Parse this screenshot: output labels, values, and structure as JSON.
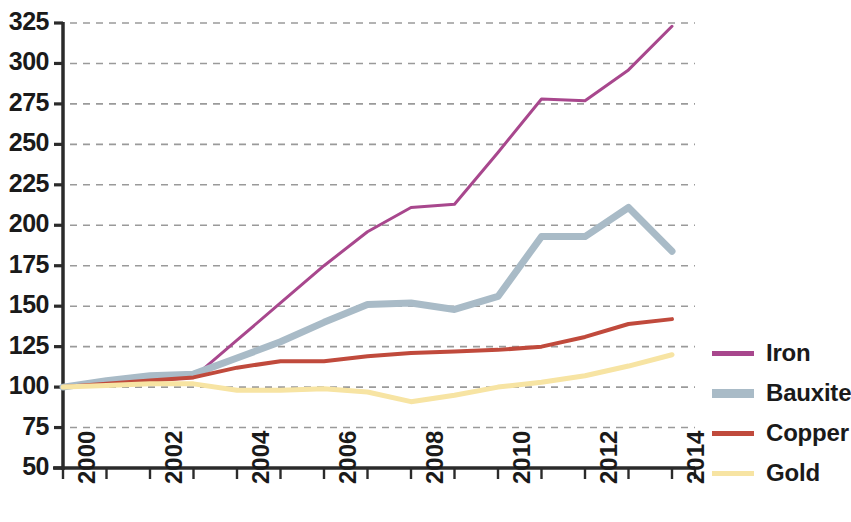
{
  "chart_data": {
    "type": "line",
    "title": "",
    "subtitle": "",
    "xlabel": "",
    "ylabel": "",
    "x": [
      2000,
      2001,
      2002,
      2003,
      2004,
      2005,
      2006,
      2007,
      2008,
      2009,
      2010,
      2011,
      2012,
      2013,
      2014
    ],
    "xlim": [
      2000,
      2014
    ],
    "ylim": [
      50,
      325
    ],
    "yticks": [
      50,
      75,
      100,
      125,
      150,
      175,
      200,
      225,
      250,
      275,
      300,
      325
    ],
    "xticks": [
      2000,
      2001,
      2002,
      2003,
      2004,
      2005,
      2006,
      2007,
      2008,
      2009,
      2010,
      2011,
      2012,
      2013,
      2014
    ],
    "xtick_labels_shown": [
      "2000",
      "2002",
      "2004",
      "2006",
      "2008",
      "2010",
      "2012",
      "2014"
    ],
    "xtick_labels_shown_values": [
      2000,
      2002,
      2004,
      2006,
      2008,
      2010,
      2012,
      2014
    ],
    "grid": "horizontal-dashed",
    "legend_position": "right",
    "series": [
      {
        "name": "Iron",
        "color": "#a8478d",
        "width": 3,
        "values": [
          100,
          102,
          104,
          106,
          129,
          152,
          175,
          196,
          211,
          213,
          245,
          278,
          277,
          296,
          323
        ]
      },
      {
        "name": "Bauxite",
        "color": "#a9bbc7",
        "width": 7,
        "values": [
          100,
          104,
          107,
          108,
          118,
          128,
          140,
          151,
          152,
          148,
          156,
          193,
          193,
          211,
          184
        ]
      },
      {
        "name": "Copper",
        "color": "#c04a3c",
        "width": 4,
        "values": [
          100,
          102,
          104,
          106,
          112,
          116,
          116,
          119,
          121,
          122,
          123,
          125,
          131,
          139,
          142
        ]
      },
      {
        "name": "Gold",
        "color": "#f7e4a3",
        "width": 5,
        "values": [
          100,
          101,
          102,
          102,
          98,
          98,
          99,
          97,
          91,
          95,
          100,
          103,
          107,
          113,
          120
        ]
      }
    ]
  },
  "legend": {
    "items": [
      {
        "label": "Iron",
        "color": "#a8478d",
        "thick": false
      },
      {
        "label": "Bauxite",
        "color": "#a9bbc7",
        "thick": true
      },
      {
        "label": "Copper",
        "color": "#c04a3c",
        "thick": false
      },
      {
        "label": "Gold",
        "color": "#f7e4a3",
        "thick": false
      }
    ]
  },
  "axes": {
    "axis_color": "#2b2b2b",
    "grid_color": "#9a9a9a"
  }
}
